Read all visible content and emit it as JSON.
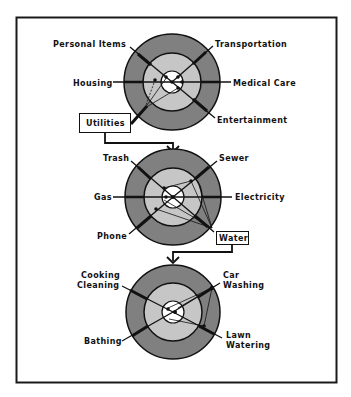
{
  "colors": {
    "frame": "#1a1a1a",
    "outer_ring": "#808080",
    "middle_ring": "#c6c6c6",
    "inner_circle": "#ffffff",
    "line": "#111111"
  },
  "diagrams": [
    {
      "id": "household-expenses",
      "labels": {
        "top_left": "Personal Items",
        "top_right": "Transportation",
        "left": "Housing",
        "right": "Medical Care",
        "bottom_right": "Entertainment"
      },
      "callout": "Utilities"
    },
    {
      "id": "utilities",
      "labels": {
        "top_left": "Trash",
        "top_right": "Sewer",
        "left": "Gas",
        "right": "Electricity",
        "bottom_left": "Phone"
      },
      "callout": "Water"
    },
    {
      "id": "water-uses",
      "labels": {
        "top_left_1": "Cooking",
        "top_left_2": "Cleaning",
        "top_right_1": "Car",
        "top_right_2": "Washing",
        "bottom_left": "Bathing",
        "bottom_right_1": "Lawn",
        "bottom_right_2": "Watering"
      }
    }
  ]
}
